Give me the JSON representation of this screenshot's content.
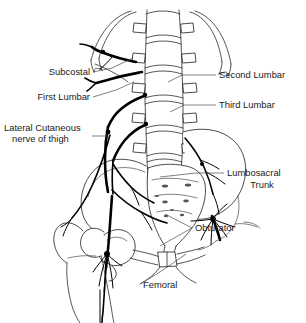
{
  "figure": {
    "background_color": "#ffffff",
    "ink_color": "#000000",
    "leader_color": "#4a4a4a",
    "width": 306,
    "height": 323
  },
  "labels": {
    "subcostal": "Subcostal",
    "first_lumbar": "First Lumbar",
    "lateral_cutaneous_line1": "Lateral Cutaneous",
    "lateral_cutaneous_line2": "nerve of thigh",
    "second_lumbar": "Second Lumbar",
    "third_lumbar": "Third Lumbar",
    "lumbosacral_trunk_line1": "Lumbosacral",
    "lumbosacral_trunk_line2": "Trunk",
    "obturator": "Obturator",
    "femoral": "Femoral"
  },
  "anatomy": {
    "structures": [
      "lumbar vertebrae",
      "ribs",
      "transverse processes",
      "sacrum",
      "sacral foramina",
      "ilium",
      "pubic symphysis",
      "femur head",
      "femur neck",
      "greater trochanter",
      "femoral shaft"
    ],
    "nerves": [
      "subcostal nerve",
      "first lumbar nerve",
      "lateral cutaneous nerve of thigh",
      "second lumbar nerve",
      "third lumbar nerve",
      "lumbosacral trunk",
      "obturator nerve",
      "femoral nerve"
    ]
  }
}
